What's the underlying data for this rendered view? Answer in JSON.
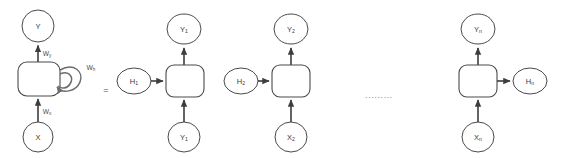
{
  "diagram": {
    "equals_sign": "=",
    "ellipsis": "........."
  },
  "colors": {
    "background": "#ffffff",
    "stroke": "#4a4a4a",
    "edge": "#3d3d3d",
    "loop": "#6b6b6b",
    "text": "#3a3a3a",
    "ellipsis": "#8a8a8a"
  },
  "folded_unit": {
    "name": "folded-rnn",
    "cell_label": "",
    "output_node": {
      "base": "Y",
      "sub": ""
    },
    "input_node": {
      "base": "X",
      "sub": ""
    },
    "weight_output": {
      "base": "W",
      "sub": "y"
    },
    "weight_input": {
      "base": "W",
      "sub": "x"
    },
    "weight_recurrent": {
      "base": "W",
      "sub": "h"
    }
  },
  "unfolded_units": [
    {
      "name": "timestep-1",
      "output_node": {
        "base": "Y",
        "sub": "1"
      },
      "input_node": {
        "base": "Y",
        "sub": "1"
      },
      "hidden_in_node": {
        "base": "H",
        "sub": "1"
      },
      "hidden_out_node": null
    },
    {
      "name": "timestep-2",
      "output_node": {
        "base": "Y",
        "sub": "2"
      },
      "input_node": {
        "base": "X",
        "sub": "2"
      },
      "hidden_in_node": {
        "base": "H",
        "sub": "2"
      },
      "hidden_out_node": null
    },
    {
      "name": "timestep-n",
      "output_node": {
        "base": "Y",
        "sub": "n"
      },
      "input_node": {
        "base": "X",
        "sub": "n"
      },
      "hidden_in_node": null,
      "hidden_out_node": {
        "base": "H",
        "sub": "n"
      }
    }
  ]
}
